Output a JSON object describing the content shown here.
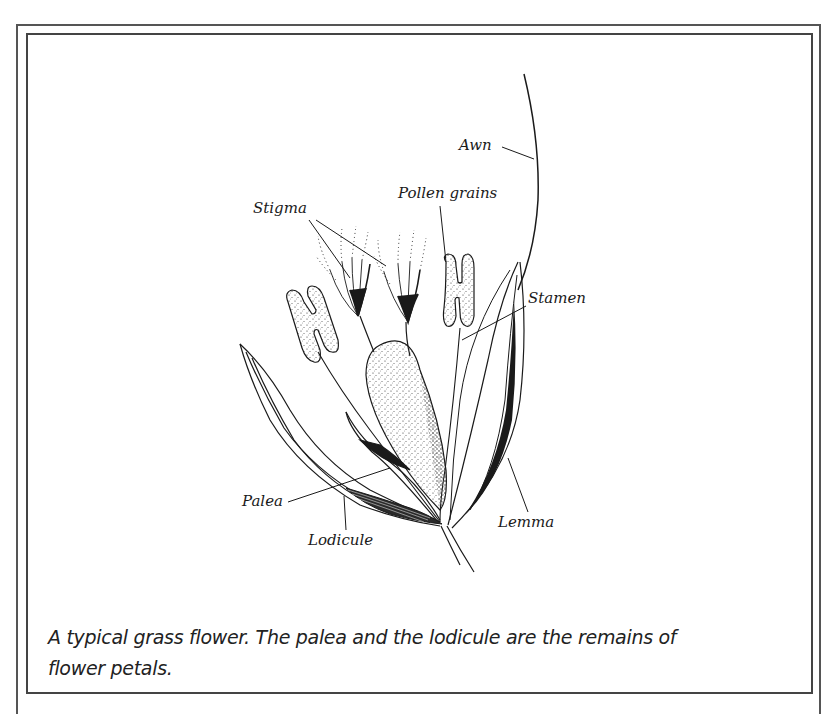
{
  "figure": {
    "title": "A typical grass flower",
    "caption": "A typical grass flower. The palea and the lodicule are the remains of flower petals.",
    "caption_lines": [
      "A typical grass flower. The palea and the lodicule are the remains of",
      "flower petals."
    ],
    "labels": {
      "awn": "Awn",
      "pollen_grains": "Pollen grains",
      "stigma": "Stigma",
      "stamen": "Stamen",
      "palea": "Palea",
      "lodicule": "Lodicule",
      "lemma": "Lemma"
    },
    "parts": [
      {
        "name": "Awn",
        "description": "long bristle extending from the lemma tip"
      },
      {
        "name": "Stigma",
        "count": 2,
        "description": "feathery stigmas on styles above ovary"
      },
      {
        "name": "Pollen grains",
        "count": 2,
        "description": "H-shaped anthers"
      },
      {
        "name": "Stamen",
        "description": "filament supporting anther"
      },
      {
        "name": "Palea",
        "description": "inner bract"
      },
      {
        "name": "Lodicule",
        "description": "small scale at base"
      },
      {
        "name": "Lemma",
        "description": "outer bract bearing the awn"
      }
    ],
    "colors": {
      "ink": "#1a1a1a",
      "frame": "#444444",
      "background": "#ffffff"
    }
  }
}
